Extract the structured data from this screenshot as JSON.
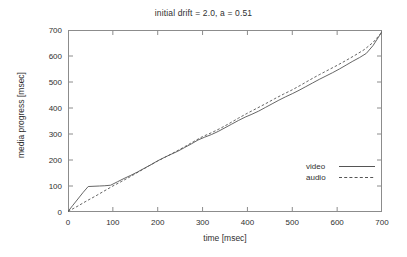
{
  "chart_data": {
    "type": "line",
    "title": "initial drift = 2.0, a = 0.51",
    "xlabel": "time [msec]",
    "ylabel": "media progress [msec]",
    "xlim": [
      0,
      700
    ],
    "ylim": [
      0,
      700
    ],
    "xticks": [
      0,
      100,
      200,
      300,
      400,
      500,
      600,
      700
    ],
    "yticks": [
      0,
      100,
      200,
      300,
      400,
      500,
      600,
      700
    ],
    "grid": false,
    "legend_position": "inside-right",
    "line_color": "#555555",
    "frame_color": "#8c8c8c",
    "series": [
      {
        "name": "video",
        "style": "solid",
        "x": [
          0,
          10,
          22,
          34,
          45,
          58,
          70,
          82,
          95,
          110,
          125,
          140,
          155,
          170,
          185,
          200,
          215,
          230,
          245,
          260,
          275,
          290,
          305,
          320,
          335,
          350,
          365,
          380,
          395,
          410,
          425,
          440,
          455,
          470,
          485,
          500,
          515,
          530,
          545,
          560,
          575,
          590,
          605,
          620,
          635,
          650,
          665,
          680,
          695,
          700
        ],
        "y": [
          2,
          24,
          50,
          76,
          98,
          99,
          100,
          101,
          103,
          116,
          129,
          141,
          154,
          168,
          182,
          197,
          210,
          222,
          234,
          248,
          262,
          277,
          288,
          298,
          310,
          324,
          338,
          352,
          365,
          376,
          388,
          402,
          416,
          430,
          443,
          455,
          468,
          482,
          496,
          510,
          523,
          536,
          550,
          565,
          580,
          594,
          610,
          640,
          680,
          695
        ]
      },
      {
        "name": "audio",
        "style": "dashed",
        "x": [
          0,
          20,
          40,
          60,
          80,
          100,
          120,
          140,
          160,
          180,
          200,
          220,
          240,
          260,
          280,
          300,
          320,
          340,
          360,
          380,
          400,
          420,
          440,
          460,
          480,
          500,
          520,
          540,
          560,
          580,
          600,
          620,
          640,
          660,
          680,
          700
        ],
        "y": [
          2,
          21,
          41,
          60,
          80,
          100,
          118,
          137,
          157,
          177,
          196,
          214,
          232,
          251,
          271,
          290,
          305,
          322,
          341,
          361,
          380,
          398,
          416,
          435,
          453,
          470,
          489,
          509,
          528,
          546,
          564,
          583,
          603,
          624,
          652,
          692
        ]
      }
    ]
  },
  "legend": {
    "items": [
      {
        "label": "video",
        "style": "solid"
      },
      {
        "label": "audio",
        "style": "dashed"
      }
    ]
  }
}
